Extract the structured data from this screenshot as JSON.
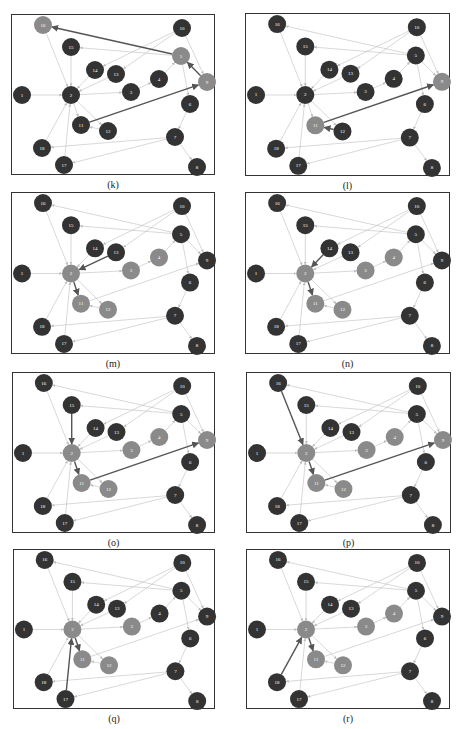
{
  "figure": {
    "layout": {
      "node_radius": 9
    },
    "colors": {
      "node_default": "#333333",
      "node_highlight": "#8a8a8a",
      "edge_default": "#bdbdbd",
      "edge_highlight": "#555555",
      "frame_border": "#333333"
    },
    "nodes": {
      "16": [
        31,
        10
      ],
      "10": [
        170,
        13
      ],
      "15": [
        59,
        32
      ],
      "5": [
        169,
        41
      ],
      "14": [
        83,
        55
      ],
      "13": [
        104,
        59
      ],
      "4": [
        147,
        64
      ],
      "9": [
        195,
        67
      ],
      "1": [
        10,
        80
      ],
      "2": [
        59,
        80
      ],
      "3": [
        119,
        77
      ],
      "6": [
        178,
        89
      ],
      "11": [
        69,
        110
      ],
      "12": [
        96,
        116
      ],
      "7": [
        163,
        122
      ],
      "18": [
        30,
        133
      ],
      "17": [
        52,
        150
      ],
      "8": [
        185,
        152
      ]
    },
    "edges": [
      [
        "1",
        "2"
      ],
      [
        "16",
        "2"
      ],
      [
        "15",
        "2"
      ],
      [
        "14",
        "2"
      ],
      [
        "13",
        "2"
      ],
      [
        "2",
        "3"
      ],
      [
        "3",
        "4"
      ],
      [
        "4",
        "5"
      ],
      [
        "5",
        "16"
      ],
      [
        "5",
        "15"
      ],
      [
        "10",
        "14"
      ],
      [
        "10",
        "13"
      ],
      [
        "10",
        "9"
      ],
      [
        "5",
        "9"
      ],
      [
        "5",
        "6"
      ],
      [
        "6",
        "7"
      ],
      [
        "7",
        "8"
      ],
      [
        "7",
        "18"
      ],
      [
        "7",
        "17"
      ],
      [
        "18",
        "2"
      ],
      [
        "17",
        "2"
      ],
      [
        "2",
        "11"
      ],
      [
        "2",
        "12"
      ],
      [
        "11",
        "9"
      ],
      [
        "12",
        "11"
      ]
    ],
    "panels": [
      {
        "id": "k",
        "caption": "(k)",
        "x": 11,
        "y": 14,
        "w": 204,
        "h": 161,
        "highlight_nodes": [
          "16",
          "5",
          "9"
        ],
        "highlight_edges": [
          [
            "5",
            "16"
          ],
          [
            "9",
            "5"
          ],
          [
            "11",
            "9"
          ]
        ]
      },
      {
        "id": "l",
        "caption": "(l)",
        "x": 245,
        "y": 13,
        "w": 205,
        "h": 163,
        "highlight_nodes": [
          "9",
          "11"
        ],
        "highlight_edges": [
          [
            "11",
            "9"
          ],
          [
            "12",
            "11"
          ]
        ]
      },
      {
        "id": "m",
        "caption": "(m)",
        "x": 11,
        "y": 192,
        "w": 204,
        "h": 162,
        "highlight_nodes": [
          "2",
          "3",
          "4",
          "11",
          "12"
        ],
        "highlight_edges": [
          [
            "13",
            "2"
          ],
          [
            "2",
            "11"
          ]
        ]
      },
      {
        "id": "n",
        "caption": "(n)",
        "x": 245,
        "y": 192,
        "w": 205,
        "h": 162,
        "highlight_nodes": [
          "2",
          "3",
          "4",
          "11",
          "12"
        ],
        "highlight_edges": [
          [
            "14",
            "2"
          ],
          [
            "2",
            "11"
          ]
        ]
      },
      {
        "id": "o",
        "caption": "(o)",
        "x": 12,
        "y": 372,
        "w": 203,
        "h": 161,
        "highlight_nodes": [
          "2",
          "3",
          "4",
          "9",
          "11",
          "12"
        ],
        "highlight_edges": [
          [
            "15",
            "2"
          ],
          [
            "2",
            "11"
          ],
          [
            "11",
            "9"
          ]
        ]
      },
      {
        "id": "p",
        "caption": "(p)",
        "x": 246,
        "y": 372,
        "w": 205,
        "h": 161,
        "highlight_nodes": [
          "2",
          "3",
          "4",
          "9",
          "11",
          "12"
        ],
        "highlight_edges": [
          [
            "16",
            "2"
          ],
          [
            "2",
            "11"
          ],
          [
            "11",
            "9"
          ]
        ]
      },
      {
        "id": "q",
        "caption": "(q)",
        "x": 13,
        "y": 549,
        "w": 202,
        "h": 160,
        "highlight_nodes": [
          "2",
          "3",
          "11",
          "12"
        ],
        "highlight_edges": [
          [
            "17",
            "2"
          ],
          [
            "2",
            "11"
          ]
        ]
      },
      {
        "id": "r",
        "caption": "(r)",
        "x": 246,
        "y": 549,
        "w": 204,
        "h": 160,
        "highlight_nodes": [
          "2",
          "3",
          "4",
          "11",
          "12"
        ],
        "highlight_edges": [
          [
            "18",
            "2"
          ],
          [
            "2",
            "11"
          ]
        ]
      }
    ]
  }
}
